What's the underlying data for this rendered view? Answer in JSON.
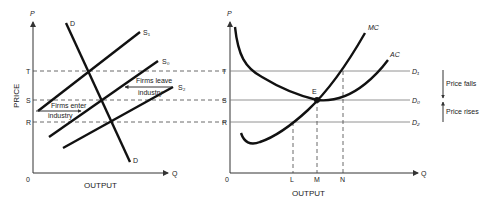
{
  "left_panel": {
    "y_axis_label": "P",
    "y_axis_title": "PRICE",
    "x_axis_label": "Q",
    "x_axis_title": "OUTPUT",
    "origin": "0",
    "price_levels": [
      "T",
      "S",
      "R"
    ],
    "demand_label_top": "D",
    "demand_label_bottom": "D",
    "supply_labels": {
      "s1": "S₁",
      "s0": "S₀",
      "s2": "S₂"
    },
    "annotation_enter_line1": "Firms enter",
    "annotation_enter_line2": "industry",
    "annotation_leave_line1": "Firms leave",
    "annotation_leave_line2": "industry"
  },
  "right_panel": {
    "y_axis_label": "P",
    "x_axis_label": "Q",
    "x_axis_title": "OUTPUT",
    "origin": "0",
    "price_levels": [
      "T",
      "S",
      "R"
    ],
    "curve_labels": {
      "mc": "MC",
      "ac": "AC"
    },
    "demand_lines": {
      "d1": "D₁",
      "d0": "D₀",
      "d2": "D₂"
    },
    "equilibrium_label": "E",
    "output_levels": [
      "L",
      "M",
      "N"
    ],
    "price_change": {
      "falls": "Price falls",
      "rises": "Price rises"
    }
  },
  "colors": {
    "curve": "#111111",
    "axis": "#333333",
    "guide": "#777777"
  }
}
